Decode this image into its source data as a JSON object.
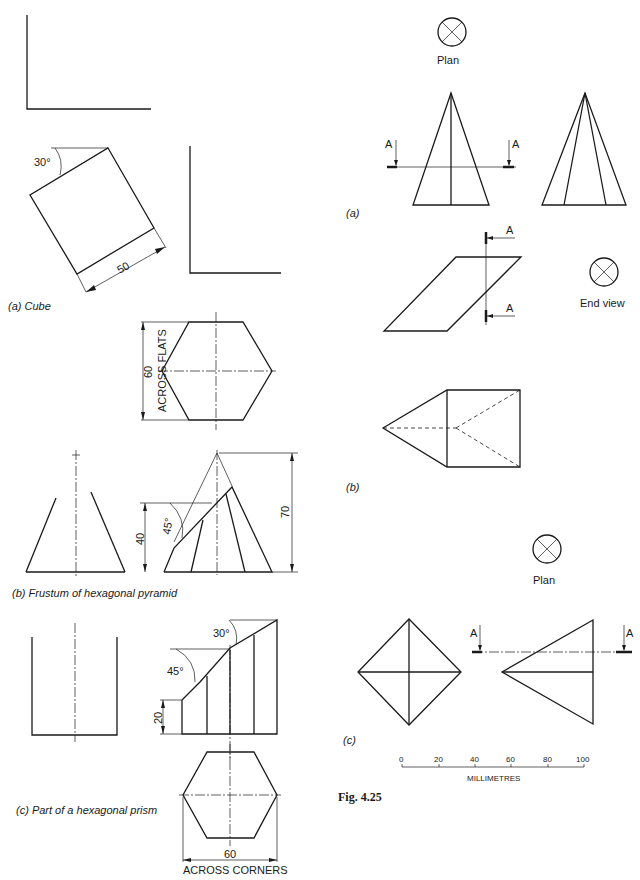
{
  "left_column": {
    "cube": {
      "caption": "(a)  Cube",
      "angle_label": "30°",
      "side_label": "50"
    },
    "frustum": {
      "caption": "(b)  Frustum of hexagonal pyramid",
      "across_flats_value": "60",
      "across_flats_label": "ACROSS FLATS",
      "height_label": "70",
      "cut_height_label": "40",
      "cut_angle_label": "45°"
    },
    "prism": {
      "caption": "(c)  Part of a hexagonal prism",
      "angle_1_label": "30°",
      "angle_2_label": "45°",
      "height_label": "20",
      "across_corners_value": "60",
      "across_corners_label": "ACROSS CORNERS"
    }
  },
  "right_column": {
    "a": {
      "symbol_label": "Plan",
      "caption": "(a)",
      "section_left": "A",
      "section_right": "A"
    },
    "b": {
      "symbol_label": "End view",
      "caption": "(b)",
      "section_top": "A",
      "section_bottom": "A"
    },
    "c": {
      "symbol_label": "Plan",
      "caption": "(c)",
      "section_left": "A",
      "section_right": "A"
    },
    "scale": {
      "ticks": [
        "0",
        "20",
        "40",
        "60",
        "80",
        "100"
      ],
      "unit_label": "MILLIMETRES"
    },
    "figure_label": "Fig. 4.25"
  }
}
